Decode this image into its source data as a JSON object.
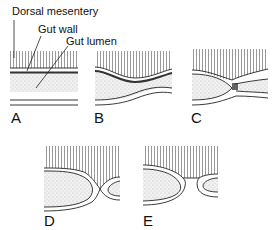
{
  "figure": {
    "callouts": [
      {
        "id": "dorsal-mesentery",
        "text": "Dorsal mesentery"
      },
      {
        "id": "gut-wall",
        "text": "Gut wall"
      },
      {
        "id": "gut-lumen",
        "text": "Gut lumen"
      }
    ],
    "panels": [
      {
        "id": "A",
        "label": "A"
      },
      {
        "id": "B",
        "label": "B"
      },
      {
        "id": "C",
        "label": "C"
      },
      {
        "id": "D",
        "label": "D"
      },
      {
        "id": "E",
        "label": "E"
      }
    ],
    "colors": {
      "line": "#222222",
      "stipple": "#9a9a9a",
      "background": "#ffffff"
    }
  }
}
